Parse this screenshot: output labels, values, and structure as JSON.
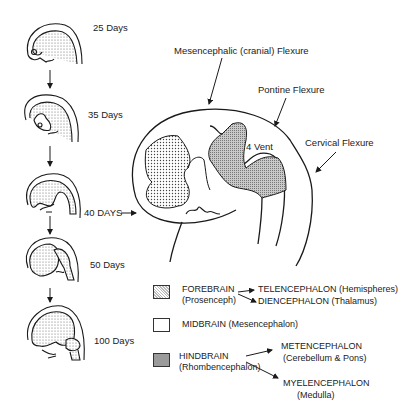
{
  "stages": [
    {
      "label": "25  Days"
    },
    {
      "label": "35  Days"
    },
    {
      "label": "40 DAYS"
    },
    {
      "label": "50  Days"
    },
    {
      "label": "100  Days"
    }
  ],
  "flexures": {
    "mesencephalic": "Mesencephalic  (cranial)  Flexure",
    "pontine": "Pontine  Flexure",
    "cervical": "Cervical  Flexure"
  },
  "ventricle_label": "4  Vent",
  "legend": {
    "forebrain": {
      "name": "FOREBRAIN",
      "alt": "(Prosenceph)",
      "subdivisions": [
        {
          "name": "TELENCEPHALON",
          "alt": "(Hemispheres)"
        },
        {
          "name": "DIENCEPHALON",
          "alt": "(Thalamus)"
        }
      ]
    },
    "midbrain": {
      "name": "MIDBRAIN",
      "alt": "(Mesencephalon)"
    },
    "hindbrain": {
      "name": "HINDBRAIN",
      "alt": "(Rhombencephalon)",
      "subdivisions": [
        {
          "name": "METENCEPHALON",
          "alt": "(Cerebellum & Pons)"
        },
        {
          "name": "MYELENCEPHALON",
          "alt": "(Medulla)"
        }
      ]
    }
  },
  "colors": {
    "line": "#1a1a1a",
    "forebrain_fill": "#d9d9d9",
    "hindbrain_fill": "#b5b5b5"
  }
}
